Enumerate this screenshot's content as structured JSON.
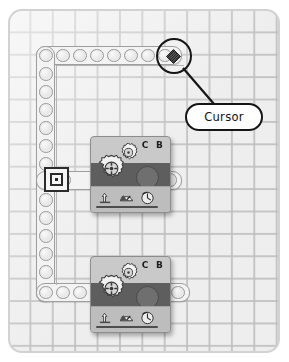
{
  "canvas": {
    "name": "nxt-g-program-canvas",
    "background_color": "#eeeeee",
    "grid_color": "#bebebe",
    "border_color": "#d2d2d2"
  },
  "sequence_beam": {
    "name": "sequence-beam",
    "color": "#f3f3f3",
    "outline_color": "#9e9e9e",
    "top_hole_count": 8,
    "left_hole_count": 11,
    "bottom_hole_count": 4,
    "start_marker": {
      "name": "sequence-beam-start-marker",
      "color": "#2b2b2b"
    }
  },
  "blocks": [
    {
      "name": "move-block-1",
      "type": "move-block",
      "ports_label": "C B",
      "band_color": "#5e5e5e",
      "body_color": "#c9c9c9",
      "icons": [
        "direction-arrow-icon",
        "power-gauge-icon",
        "duration-rotation-icon"
      ]
    },
    {
      "name": "move-block-2",
      "type": "move-block",
      "ports_label": "C B",
      "band_color": "#5e5e5e",
      "body_color": "#c9c9c9",
      "icons": [
        "direction-arrow-icon",
        "power-gauge-icon",
        "duration-rotation-icon"
      ]
    }
  ],
  "annotation": {
    "name": "cursor-annotation",
    "label": "Cursor",
    "highlight_shape": "circle",
    "marker_shape": "diamond",
    "stroke_color": "#151515",
    "fill_color": "#ffffff"
  }
}
